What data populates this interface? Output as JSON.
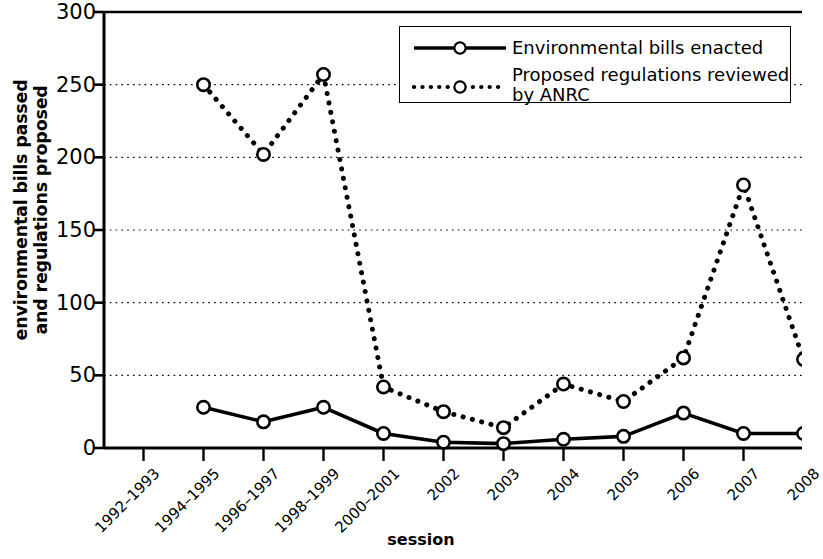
{
  "chart_data": {
    "type": "line",
    "title": "",
    "xlabel": "session",
    "ylabel": "environmental bills passed\nand regulations proposed",
    "categories": [
      "1992–1993",
      "1994–1995",
      "1996–1997",
      "1998–1999",
      "2000–2001",
      "2002",
      "2003",
      "2004",
      "2005",
      "2006",
      "2007",
      "2008"
    ],
    "ylim": [
      0,
      300
    ],
    "yticks": [
      0,
      50,
      100,
      150,
      200,
      250,
      300
    ],
    "ytick_labels": [
      "0",
      "50",
      "100",
      "150",
      "200",
      "250",
      "300"
    ],
    "grid": true,
    "grid_style": "dotted-horizontal",
    "legend_position": "top-right",
    "series": [
      {
        "name": "Environmental bills enacted",
        "style": "solid",
        "marker": "open-circle",
        "color": "#000000",
        "values": [
          null,
          28,
          18,
          28,
          10,
          4,
          3,
          6,
          8,
          24,
          10,
          10
        ]
      },
      {
        "name": "Proposed regulations reviewed\nby ANRC",
        "style": "dotted",
        "marker": "open-circle",
        "color": "#000000",
        "values": [
          null,
          250,
          202,
          257,
          42,
          25,
          14,
          44,
          32,
          62,
          181,
          61
        ]
      }
    ]
  },
  "legend": {
    "entries": [
      {
        "label": "Environmental bills enacted",
        "style": "solid"
      },
      {
        "label": "Proposed regulations reviewed\nby ANRC",
        "style": "dotted"
      }
    ]
  },
  "axes": {
    "x_title": "session",
    "y_title": "environmental bills passed\nand regulations proposed"
  }
}
